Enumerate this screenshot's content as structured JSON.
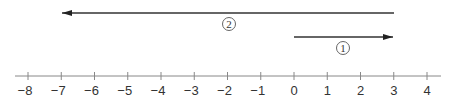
{
  "diagram": {
    "type": "number-line",
    "axis": {
      "min": -8,
      "max": 4,
      "step": 1,
      "ticks": [
        -8,
        -7,
        -6,
        -5,
        -4,
        -3,
        -2,
        -1,
        0,
        1,
        2,
        3,
        4
      ],
      "tick_labels": [
        "−8",
        "−7",
        "−6",
        "−5",
        "−4",
        "−3",
        "−2",
        "−1",
        "0",
        "1",
        "2",
        "3",
        "4"
      ],
      "color": "#888888"
    },
    "arrows": [
      {
        "id": "1",
        "label": "①",
        "from": 0,
        "to": 3,
        "direction": "right",
        "color": "#333333"
      },
      {
        "id": "2",
        "label": "②",
        "from": 3,
        "to": -7,
        "direction": "left",
        "color": "#333333"
      }
    ]
  }
}
